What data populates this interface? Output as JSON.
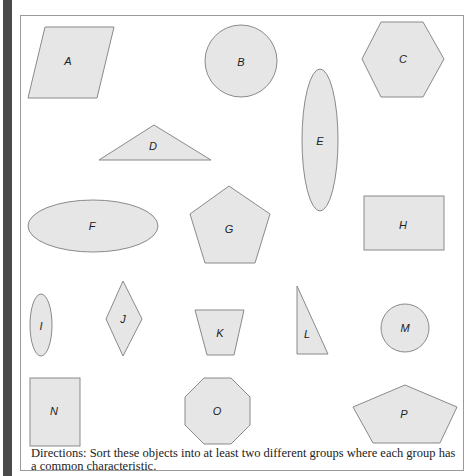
{
  "figure": {
    "directions": "Directions: Sort these objects into at least two different groups where each group has a common characteristic.",
    "colors": {
      "fill": "#e6e6e6",
      "stroke": "#8a8a8a",
      "frame": "#9a9a9a",
      "side_bar": "#4a4a4a"
    },
    "shapes": [
      {
        "label": "A",
        "type": "parallelogram"
      },
      {
        "label": "B",
        "type": "circle"
      },
      {
        "label": "C",
        "type": "hexagon"
      },
      {
        "label": "D",
        "type": "obtuse-triangle"
      },
      {
        "label": "E",
        "type": "vertical-ellipse"
      },
      {
        "label": "F",
        "type": "horizontal-ellipse"
      },
      {
        "label": "G",
        "type": "pentagon"
      },
      {
        "label": "H",
        "type": "rectangle"
      },
      {
        "label": "I",
        "type": "vertical-ellipse"
      },
      {
        "label": "J",
        "type": "rhombus"
      },
      {
        "label": "K",
        "type": "trapezoid"
      },
      {
        "label": "L",
        "type": "right-triangle"
      },
      {
        "label": "M",
        "type": "circle"
      },
      {
        "label": "N",
        "type": "rectangle"
      },
      {
        "label": "O",
        "type": "octagon"
      },
      {
        "label": "P",
        "type": "pentagon"
      }
    ]
  }
}
